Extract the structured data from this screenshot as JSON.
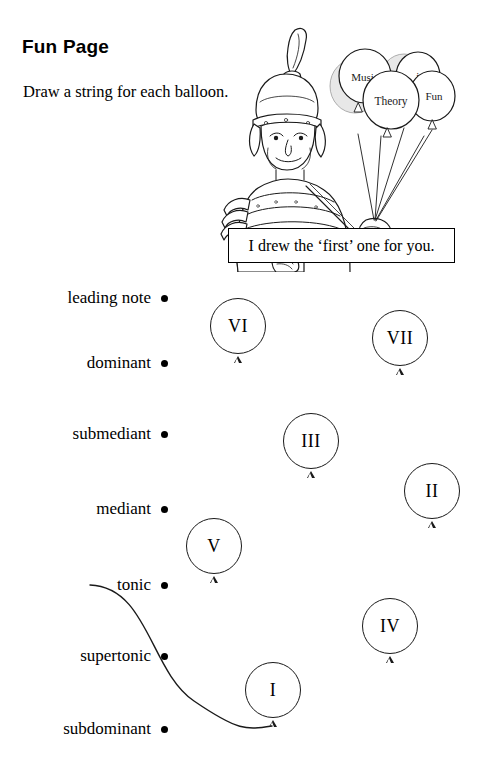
{
  "page": {
    "title": "Fun Page",
    "instruction": "Draw a string for each balloon."
  },
  "speech_box": {
    "text": "I drew the ‘first’ one for you."
  },
  "illustration": {
    "character": "roman-centurion",
    "balloon_labels": [
      "Music",
      "is",
      "Theory",
      "Fun"
    ]
  },
  "degrees": [
    {
      "label": "leading note",
      "top": 288
    },
    {
      "label": "dominant",
      "top": 353
    },
    {
      "label": "submediant",
      "top": 424
    },
    {
      "label": "mediant",
      "top": 499
    },
    {
      "label": "tonic",
      "top": 575
    },
    {
      "label": "supertonic",
      "top": 646
    },
    {
      "label": "subdominant",
      "top": 719
    }
  ],
  "balloons": [
    {
      "numeral": "VI",
      "left": 210,
      "top": 298
    },
    {
      "numeral": "VII",
      "left": 372,
      "top": 310
    },
    {
      "numeral": "III",
      "left": 283,
      "top": 413
    },
    {
      "numeral": "II",
      "left": 404,
      "top": 463
    },
    {
      "numeral": "V",
      "left": 186,
      "top": 518
    },
    {
      "numeral": "IV",
      "left": 362,
      "top": 598
    },
    {
      "numeral": "I",
      "left": 245,
      "top": 662
    }
  ],
  "drawn_string": {
    "from": "tonic",
    "to": "I",
    "start_x": 90,
    "start_y": 585,
    "end_x": 272,
    "end_y": 726
  },
  "colors": {
    "ink": "#000000",
    "line": "#1a1a1a",
    "background": "#ffffff"
  }
}
